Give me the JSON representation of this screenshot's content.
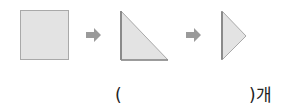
{
  "figures": [
    {
      "shape": "square",
      "label": "paper-square"
    },
    {
      "shape": "right-triangle",
      "label": "folded-in-half"
    },
    {
      "shape": "small-triangle",
      "label": "folded-again"
    }
  ],
  "arrows": [
    "arrow-right",
    "arrow-right"
  ],
  "colors": {
    "paper_fill": "#e3e3e3",
    "paper_edge": "#a9a9a9",
    "arrow": "#9a9a9a",
    "fold_shadow": "#8a8a8a"
  },
  "answer": {
    "open_paren": "(",
    "close_paren_unit": ")개",
    "value": ""
  }
}
